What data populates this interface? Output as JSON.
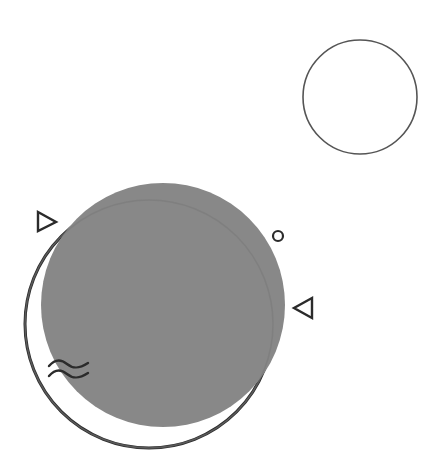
{
  "illustration": {
    "title": "Abstract geometric composition",
    "colors": {
      "background": "#ffffff",
      "fill_gray": "#888888",
      "stroke_dark": "#2b2b2b",
      "stroke_light": "#555555"
    },
    "shapes": [
      {
        "id": "outline-circle-small",
        "type": "circle-outline",
        "cx": 360,
        "cy": 97,
        "r": 57
      },
      {
        "id": "filled-circle",
        "type": "circle-filled",
        "cx": 163,
        "cy": 305,
        "r": 122
      },
      {
        "id": "outline-circle-large",
        "type": "circle-outline",
        "cx": 149,
        "cy": 324,
        "r": 124
      },
      {
        "id": "triangle-right",
        "type": "triangle",
        "direction": "right"
      },
      {
        "id": "triangle-left",
        "type": "triangle",
        "direction": "left"
      },
      {
        "id": "small-ring",
        "type": "ring",
        "cx": 278,
        "cy": 236,
        "r": 5
      },
      {
        "id": "wave-lines",
        "type": "waves",
        "count": 2
      }
    ]
  }
}
